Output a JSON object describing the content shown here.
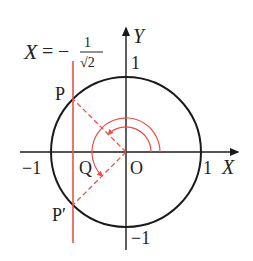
{
  "diagram": {
    "title_equation": {
      "lhs": "X",
      "eq": "=",
      "sign": "−",
      "numerator": "1",
      "denominator": "√2"
    },
    "axes": {
      "x_label": "X",
      "y_label": "Y",
      "origin_label": "O",
      "x_pos_tick": "1",
      "x_neg_tick": "−1",
      "y_pos_tick": "1",
      "y_neg_tick": "−1"
    },
    "points": {
      "P": "P",
      "P_prime": "P′",
      "Q": "Q"
    },
    "colors": {
      "circle": "#1a1a1a",
      "axes": "#1a1a1a",
      "red_line": "#e8514a",
      "dashed": "#e8514a",
      "arcs": "#e8514a"
    },
    "geometry": {
      "center": [
        126,
        152
      ],
      "radius": 75,
      "vertical_line_x": -0.7071
    }
  }
}
